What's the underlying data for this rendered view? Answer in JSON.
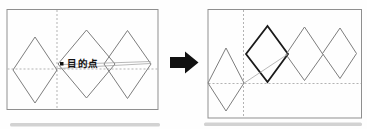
{
  "figure": {
    "label_destination": "目的点",
    "colors": {
      "frame_gray": "#8f8f8f",
      "shape_gray": "#7d7d7d",
      "dash_gray": "#b3b3b3",
      "highlight_black": "#1a1a1a",
      "arrow_black": "#111111",
      "text_black": "#111111",
      "shadow_gray": "#9e9e9e"
    },
    "left_panel": {
      "frame": {
        "x": 7,
        "y": 9.5,
        "w": 151,
        "h": 100
      },
      "dashed_vertical_x": 57,
      "dashed_horizontal_y": 69,
      "diamonds": [
        {
          "name": "left-diamond-1",
          "points": "35,37 57,70 35,103 13,70",
          "bold": false
        },
        {
          "name": "left-diamond-2",
          "points": "86.5,30 115,64 86.5,98 58,64",
          "bold": false
        },
        {
          "name": "left-diamond-3",
          "points": "127.5,30.5 151,64 127.5,98.5 104,64",
          "bold": false
        }
      ],
      "destination_point": {
        "x": 60,
        "y": 62,
        "size": 3.5
      },
      "label_anchor": {
        "x": 67,
        "y": 66.5
      },
      "sight_lines": [
        {
          "x1": 63,
          "y1": 64.5,
          "x2": 150.5,
          "y2": 61.5
        },
        {
          "x1": 57.5,
          "y1": 68.5,
          "x2": 150.5,
          "y2": 63.5
        }
      ]
    },
    "arrow": {
      "name": "transform-arrow-icon",
      "points": "170,57 185,57 185,51.5 198.5,62.5 185,73.5 185,68 170,68"
    },
    "right_panel": {
      "frame": {
        "x": 208,
        "y": 9.5,
        "w": 153.5,
        "h": 108.5
      },
      "dashed_vertical_x": 243.5,
      "dashed_horizontal_y": 83.5,
      "diamonds": [
        {
          "name": "right-diamond-small",
          "points": "226,48 244,83 226,111 208,83",
          "bold": false
        },
        {
          "name": "right-diamond-selected",
          "points": "267.5,26 288,54 267.5,82 246,54",
          "bold": true
        },
        {
          "name": "right-diamond-3",
          "points": "304.5,27 323,54.5 304.5,80.5 286,54.5",
          "bold": false
        },
        {
          "name": "right-diamond-4",
          "points": "340,28 356.5,53.5 340,78.5 322.5,53.5",
          "bold": false
        }
      ],
      "sight_lines": [
        {
          "x1": 243.5,
          "y1": 83.5,
          "x2": 288,
          "y2": 54
        }
      ]
    },
    "shadows": [
      {
        "x": 10,
        "y": 123,
        "w": 150,
        "h": 3.5
      },
      {
        "x": 204,
        "y": 122.5,
        "w": 158,
        "h": 3.5
      }
    ]
  }
}
